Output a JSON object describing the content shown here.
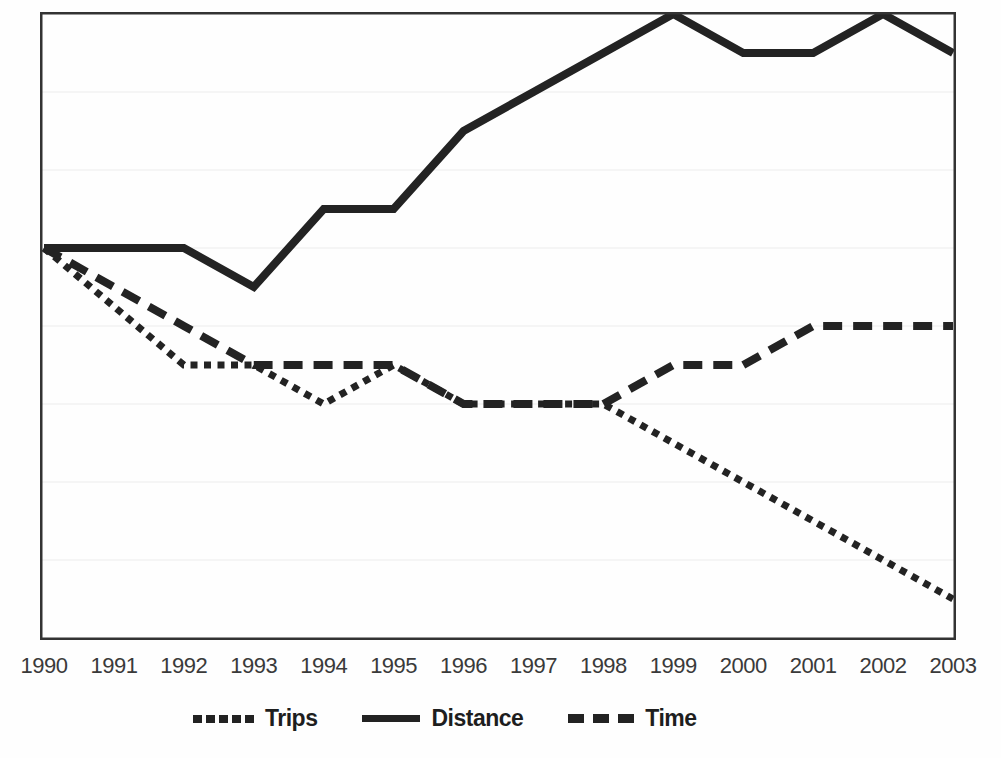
{
  "chart_data": {
    "type": "line",
    "title": "",
    "xlabel": "",
    "ylabel": "",
    "categories": [
      "1990",
      "1991",
      "1992",
      "1993",
      "1994",
      "1995",
      "1996",
      "1997",
      "1998",
      "1999",
      "2000",
      "2001",
      "2002",
      "2003"
    ],
    "series": [
      {
        "name": "Trips",
        "style": "dotted",
        "values": [
          100,
          85,
          70,
          70,
          60,
          70,
          60,
          60,
          60,
          50,
          40,
          30,
          20,
          10
        ]
      },
      {
        "name": "Distance",
        "style": "solid",
        "values": [
          100,
          100,
          100,
          90,
          110,
          110,
          130,
          140,
          150,
          160,
          150,
          150,
          160,
          150
        ]
      },
      {
        "name": "Time",
        "style": "dashed",
        "values": [
          100,
          90,
          80,
          70,
          70,
          70,
          60,
          60,
          60,
          70,
          70,
          80,
          80,
          80
        ]
      }
    ],
    "ylim": [
      0,
      160
    ],
    "y_gridline_step": 20,
    "y_axis_labels_visible": false,
    "grid": true,
    "legend_position": "bottom",
    "line_color": "#232323",
    "gridline_color": "#ececec",
    "border_color": "#333333"
  }
}
